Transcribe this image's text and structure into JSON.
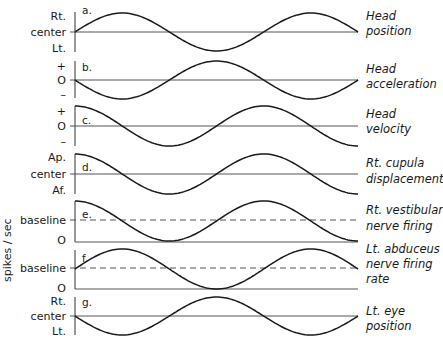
{
  "figure": {
    "side_axis_label": "spikes / sec",
    "panels": [
      {
        "letter": "a.",
        "labels": [
          "Rt.",
          "center",
          "Lt."
        ],
        "caption": [
          "Head",
          "position"
        ],
        "shape": "sin",
        "dashed_baseline": false
      },
      {
        "letter": "b.",
        "labels": [
          "+",
          "O",
          "–"
        ],
        "caption": [
          "Head",
          "acceleration"
        ],
        "shape": "-sin",
        "dashed_baseline": false
      },
      {
        "letter": "c.",
        "labels": [
          "+",
          "O",
          "–"
        ],
        "caption": [
          "Head",
          "velocity"
        ],
        "shape": "cos",
        "dashed_baseline": false
      },
      {
        "letter": "d.",
        "labels": [
          "Ap.",
          "center",
          "Af."
        ],
        "caption": [
          "Rt. cupula",
          "displacement"
        ],
        "shape": "cos",
        "dashed_baseline": false
      },
      {
        "letter": "e.",
        "labels": [
          "baseline",
          "O"
        ],
        "caption": [
          "Rt. vestibular",
          "nerve firing"
        ],
        "shape": "cos",
        "dashed_baseline": true
      },
      {
        "letter": "f.",
        "labels": [
          "baseline",
          "O"
        ],
        "caption": [
          "Lt. abduceus",
          "nerve firing",
          "rate"
        ],
        "shape": "sin",
        "dashed_baseline": true
      },
      {
        "letter": "g.",
        "labels": [
          "Rt.",
          "center",
          "Lt."
        ],
        "caption": [
          "Lt. eye",
          "position"
        ],
        "shape": "-sin",
        "dashed_baseline": false
      }
    ]
  },
  "chart_data": {
    "type": "line",
    "title": "",
    "xlabel": "time",
    "ylabel": "spikes / sec (panels e, f)",
    "cycles_shown": 1.5,
    "series": [
      {
        "name": "Head position",
        "function": "sin(t)"
      },
      {
        "name": "Head acceleration",
        "function": "-sin(t)"
      },
      {
        "name": "Head velocity",
        "function": "cos(t)"
      },
      {
        "name": "Rt. cupula displacement",
        "function": "cos(t)"
      },
      {
        "name": "Rt. vestibular nerve firing",
        "function": "baseline + cos(t)"
      },
      {
        "name": "Lt. abduceus nerve firing rate",
        "function": "baseline + sin(t)"
      },
      {
        "name": "Lt. eye position",
        "function": "-sin(t)"
      }
    ]
  }
}
